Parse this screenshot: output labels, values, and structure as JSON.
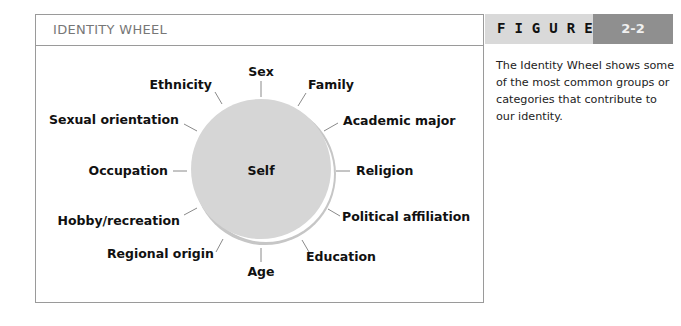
{
  "panel": {
    "title": "IDENTITY WHEEL"
  },
  "figure": {
    "label": "FIGURE",
    "number": "2-2",
    "caption": "The Identity Wheel shows some of the most common groups or categories that contribute to our identity."
  },
  "wheel": {
    "center_label": "Self",
    "spokes": [
      {
        "label": "Sex"
      },
      {
        "label": "Family"
      },
      {
        "label": "Academic major"
      },
      {
        "label": "Religion"
      },
      {
        "label": "Political affiliation"
      },
      {
        "label": "Education"
      },
      {
        "label": "Age"
      },
      {
        "label": "Regional origin"
      },
      {
        "label": "Hobby/recreation"
      },
      {
        "label": "Occupation"
      },
      {
        "label": "Sexual orientation"
      },
      {
        "label": "Ethnicity"
      }
    ],
    "colors": {
      "disc": "#d6d6d6",
      "shadow": "#c4c4c4",
      "spoke": "#8a8a8a"
    }
  }
}
